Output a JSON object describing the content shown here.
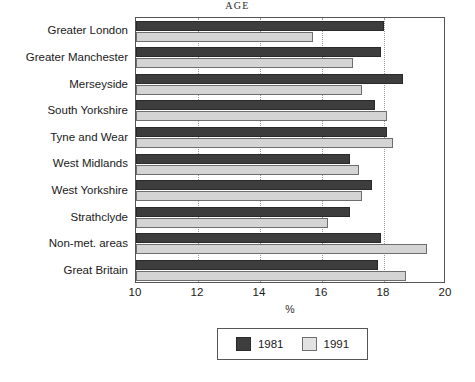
{
  "chart_data": {
    "type": "bar",
    "orientation": "horizontal",
    "title": "AGE",
    "xlabel": "%",
    "ylabel": "",
    "xlim": [
      10,
      20
    ],
    "xticks": [
      10,
      12,
      14,
      16,
      18,
      20
    ],
    "grid": "vertical-dotted-at-major-ticks",
    "legend_position": "bottom-center",
    "categories": [
      "Greater London",
      "Greater Manchester",
      "Merseyside",
      "South Yorkshire",
      "Tyne and Wear",
      "West Midlands",
      "West Yorkshire",
      "Strathclyde",
      "Non-met. areas",
      "Great Britain"
    ],
    "series": [
      {
        "name": "1981",
        "color": "#3d3d3d",
        "values": [
          18.0,
          17.9,
          18.6,
          17.7,
          18.1,
          16.9,
          17.6,
          16.9,
          17.9,
          17.8
        ]
      },
      {
        "name": "1991",
        "color": "#d4d4d4",
        "values": [
          15.7,
          17.0,
          17.3,
          18.1,
          18.3,
          17.2,
          17.3,
          16.2,
          19.4,
          18.7
        ]
      }
    ]
  },
  "legend": {
    "items": [
      {
        "label": "1981"
      },
      {
        "label": "1991"
      }
    ]
  }
}
